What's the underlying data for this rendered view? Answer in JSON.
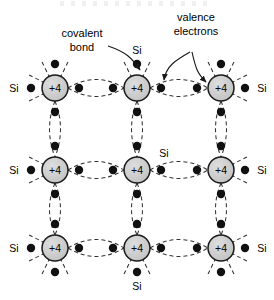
{
  "figure": {
    "background": "#ffffff",
    "width": 274,
    "height": 300
  },
  "style": {
    "atom_fill": "#cccccc",
    "atom_stroke": "#1a1a1a",
    "electron_fill": "#111111",
    "bond_stroke": "#333333",
    "text_color": "#000000",
    "atom_radius": 13,
    "electron_radius": 4.2,
    "dash_pattern": "4,3"
  },
  "atoms": [
    {
      "id": "a00",
      "core_label": "+4",
      "cx": 55,
      "cy": 88
    },
    {
      "id": "a01",
      "core_label": "+4",
      "cx": 137,
      "cy": 88
    },
    {
      "id": "a02",
      "core_label": "+4",
      "cx": 221,
      "cy": 88
    },
    {
      "id": "a10",
      "core_label": "+4",
      "cx": 55,
      "cy": 170
    },
    {
      "id": "a11",
      "core_label": "+4",
      "cx": 137,
      "cy": 170
    },
    {
      "id": "a12",
      "core_label": "+4",
      "cx": 221,
      "cy": 170
    },
    {
      "id": "a20",
      "core_label": "+4",
      "cx": 55,
      "cy": 248
    },
    {
      "id": "a21",
      "core_label": "+4",
      "cx": 137,
      "cy": 248
    },
    {
      "id": "a22",
      "core_label": "+4",
      "cx": 221,
      "cy": 248
    }
  ],
  "si_labels": [
    {
      "id": "si-left-top",
      "text": "Si",
      "x": 14,
      "y": 92,
      "anchor": "middle"
    },
    {
      "id": "si-left-mid",
      "text": "Si",
      "x": 14,
      "y": 174,
      "anchor": "middle"
    },
    {
      "id": "si-left-bot",
      "text": "Si",
      "x": 14,
      "y": 252,
      "anchor": "middle"
    },
    {
      "id": "si-right-top",
      "text": "Si",
      "x": 262,
      "y": 92,
      "anchor": "middle"
    },
    {
      "id": "si-right-mid",
      "text": "Si",
      "x": 262,
      "y": 174,
      "anchor": "middle"
    },
    {
      "id": "si-right-bot",
      "text": "Si",
      "x": 262,
      "y": 252,
      "anchor": "middle"
    },
    {
      "id": "si-top-center",
      "text": "Si",
      "x": 137,
      "y": 54,
      "anchor": "middle"
    },
    {
      "id": "si-inner-center",
      "text": "Si",
      "x": 164,
      "y": 157,
      "anchor": "middle"
    },
    {
      "id": "si-bottom-center",
      "text": "Si",
      "x": 137,
      "y": 290,
      "anchor": "middle"
    }
  ],
  "annotations": [
    {
      "id": "covalent-bond",
      "lines": [
        "covalent",
        "bond"
      ],
      "x": 82,
      "y": 37,
      "line_height": 14,
      "anchor": "middle"
    },
    {
      "id": "valence-electrons",
      "lines": [
        "valence",
        "electrons"
      ],
      "x": 196,
      "y": 21,
      "line_height": 14,
      "anchor": "middle"
    }
  ],
  "leader_arrows": [
    {
      "id": "arrow-covalent-bond",
      "path": "M 108 46 C 126 52, 132 58, 140 70",
      "tip": [
        140,
        72
      ]
    },
    {
      "id": "arrow-valence-left",
      "path": "M 190 52 C 176 60, 166 66, 164 80",
      "tip": [
        164,
        83
      ]
    },
    {
      "id": "arrow-valence-right",
      "path": "M 192 52 C 196 70, 198 74, 206 82",
      "tip": [
        208,
        84
      ]
    }
  ],
  "legend_terms": {
    "covalent_bond": "covalent bond",
    "valence_electrons": "valence electrons",
    "atom_core": "+4",
    "element": "Si"
  }
}
